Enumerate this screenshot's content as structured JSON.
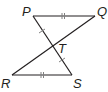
{
  "diagram": {
    "type": "geometry",
    "points": {
      "P": {
        "label": "P",
        "x": 33,
        "y": 16
      },
      "Q": {
        "label": "Q",
        "x": 95,
        "y": 16
      },
      "R": {
        "label": "R",
        "x": 12,
        "y": 75
      },
      "S": {
        "label": "S",
        "x": 72,
        "y": 75
      },
      "T": {
        "label": "T",
        "x": 52,
        "y": 47
      }
    },
    "segments": [
      {
        "from": "P",
        "to": "Q",
        "ticks": 2
      },
      {
        "from": "R",
        "to": "S",
        "ticks": 2
      },
      {
        "from": "P",
        "to": "S",
        "ticks_each_half": 1
      },
      {
        "from": "Q",
        "to": "R",
        "ticks": 0
      }
    ],
    "colors": {
      "line": "#231f20",
      "tick": "#808080"
    }
  }
}
